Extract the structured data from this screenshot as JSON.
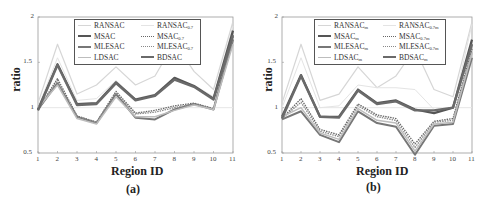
{
  "chart_data": [
    {
      "type": "line",
      "panel_label": "(a)",
      "title": "",
      "xlabel": "Region ID",
      "ylabel": "ratio",
      "xlim": [
        1,
        11
      ],
      "ylim": [
        0.5,
        2
      ],
      "x": [
        1,
        2,
        3,
        4,
        5,
        6,
        7,
        8,
        9,
        10,
        11
      ],
      "xticks": [
        "1",
        "2",
        "3",
        "4",
        "5",
        "6",
        "7",
        "8",
        "9",
        "10",
        "11"
      ],
      "yticks": [
        "0.5",
        "1",
        "1.5",
        "2"
      ],
      "grid": false,
      "reference_line": 1,
      "legend_position": "upper center",
      "series": [
        {
          "name": "RANSAC",
          "sub": "",
          "color": "#d6d6d6",
          "width": 1.2,
          "dash": "",
          "values": [
            1.05,
            1.7,
            1.15,
            1.25,
            1.45,
            1.25,
            1.35,
            1.72,
            1.4,
            1.2,
            1.95
          ]
        },
        {
          "name": "RANSAC",
          "sub": "0.7",
          "color": "#e4e4e4",
          "width": 1.0,
          "dash": "",
          "values": [
            1.0,
            1.55,
            1.08,
            1.1,
            1.3,
            1.1,
            1.15,
            1.3,
            1.25,
            1.12,
            1.9
          ]
        },
        {
          "name": "MSAC",
          "sub": "",
          "color": "#555555",
          "width": 2.2,
          "dash": "",
          "values": [
            0.98,
            1.48,
            1.04,
            1.05,
            1.28,
            1.09,
            1.14,
            1.33,
            1.24,
            1.1,
            1.85
          ]
        },
        {
          "name": "MSAC",
          "sub": "0.7",
          "color": "#666666",
          "width": 1.3,
          "dash": "1.5,1",
          "values": [
            0.98,
            1.32,
            0.91,
            0.84,
            1.18,
            0.94,
            0.97,
            1.02,
            1.05,
            0.99,
            1.78
          ]
        },
        {
          "name": "MLESAC",
          "sub": "",
          "color": "#777777",
          "width": 2.0,
          "dash": "",
          "values": [
            0.98,
            1.27,
            0.9,
            0.83,
            1.15,
            0.89,
            0.87,
            0.98,
            1.04,
            0.98,
            1.75
          ]
        },
        {
          "name": "MLESAC",
          "sub": "0.7",
          "color": "#888888",
          "width": 1.3,
          "dash": "1.5,1",
          "values": [
            0.97,
            1.3,
            0.9,
            0.84,
            1.16,
            0.93,
            0.95,
            1.0,
            1.04,
            0.98,
            1.76
          ]
        },
        {
          "name": "LDSAC",
          "sub": "",
          "color": "#bdbdbd",
          "width": 1.5,
          "dash": "",
          "values": [
            1.0,
            1.25,
            0.88,
            0.82,
            1.12,
            0.9,
            0.9,
            0.97,
            1.03,
            0.98,
            1.7
          ]
        },
        {
          "name": "BDSAC",
          "sub": "",
          "color": "#6a6a6a",
          "width": 2.4,
          "dash": "",
          "values": [
            0.97,
            1.47,
            1.03,
            1.04,
            1.27,
            1.08,
            1.13,
            1.31,
            1.23,
            1.09,
            1.8
          ]
        }
      ]
    },
    {
      "type": "line",
      "panel_label": "(b)",
      "title": "",
      "xlabel": "Region ID",
      "ylabel": "ratio",
      "xlim": [
        1,
        11
      ],
      "ylim": [
        0.5,
        2
      ],
      "x": [
        1,
        2,
        3,
        4,
        5,
        6,
        7,
        8,
        9,
        10,
        11
      ],
      "xticks": [
        "1",
        "2",
        "3",
        "4",
        "5",
        "6",
        "7",
        "8",
        "9",
        "10",
        "11"
      ],
      "yticks": [
        "0.5",
        "1",
        "1.5",
        "2"
      ],
      "grid": false,
      "reference_line": 1,
      "legend_position": "upper center",
      "series": [
        {
          "name": "RANSAC",
          "sub": "m",
          "color": "#d6d6d6",
          "width": 1.2,
          "dash": "",
          "values": [
            1.05,
            1.7,
            1.08,
            1.15,
            1.45,
            1.22,
            1.35,
            1.65,
            1.2,
            1.12,
            1.95
          ]
        },
        {
          "name": "RANSAC",
          "sub": "0.7m",
          "color": "#e4e4e4",
          "width": 1.0,
          "dash": "",
          "values": [
            1.0,
            1.55,
            1.0,
            1.02,
            1.25,
            1.22,
            1.22,
            1.2,
            0.98,
            1.0,
            1.92
          ]
        },
        {
          "name": "MSAC",
          "sub": "m",
          "color": "#555555",
          "width": 2.2,
          "dash": "",
          "values": [
            0.9,
            1.36,
            0.9,
            0.9,
            1.2,
            1.05,
            1.08,
            0.98,
            0.94,
            1.0,
            1.75
          ]
        },
        {
          "name": "MSAC",
          "sub": "0.7m",
          "color": "#666666",
          "width": 1.3,
          "dash": "1.5,1",
          "values": [
            0.88,
            1.1,
            0.76,
            0.7,
            1.04,
            0.92,
            0.88,
            0.6,
            0.85,
            0.88,
            1.65
          ]
        },
        {
          "name": "MLESAC",
          "sub": "m",
          "color": "#777777",
          "width": 2.0,
          "dash": "",
          "values": [
            0.87,
            0.96,
            0.7,
            0.62,
            0.96,
            0.83,
            0.79,
            0.48,
            0.8,
            0.82,
            1.55
          ]
        },
        {
          "name": "MLESAC",
          "sub": "0.7m",
          "color": "#888888",
          "width": 1.3,
          "dash": "1.5,1",
          "values": [
            0.88,
            1.06,
            0.74,
            0.68,
            1.02,
            0.9,
            0.86,
            0.56,
            0.84,
            0.86,
            1.62
          ]
        },
        {
          "name": "LDSAC",
          "sub": "m",
          "color": "#bdbdbd",
          "width": 1.5,
          "dash": "",
          "values": [
            0.9,
            1.0,
            0.72,
            0.65,
            0.99,
            0.86,
            0.83,
            0.52,
            0.82,
            0.84,
            1.6
          ]
        },
        {
          "name": "BDSAC",
          "sub": "m",
          "color": "#6a6a6a",
          "width": 2.4,
          "dash": "",
          "values": [
            0.88,
            1.35,
            0.9,
            0.89,
            1.19,
            1.04,
            1.07,
            0.97,
            0.97,
            1.0,
            1.7
          ]
        }
      ]
    }
  ],
  "panels": [
    {
      "caption": "(a)",
      "xlabel": "Region ID",
      "ylabel": "ratio"
    },
    {
      "caption": "(b)",
      "xlabel": "Region ID",
      "ylabel": "ratio"
    }
  ]
}
